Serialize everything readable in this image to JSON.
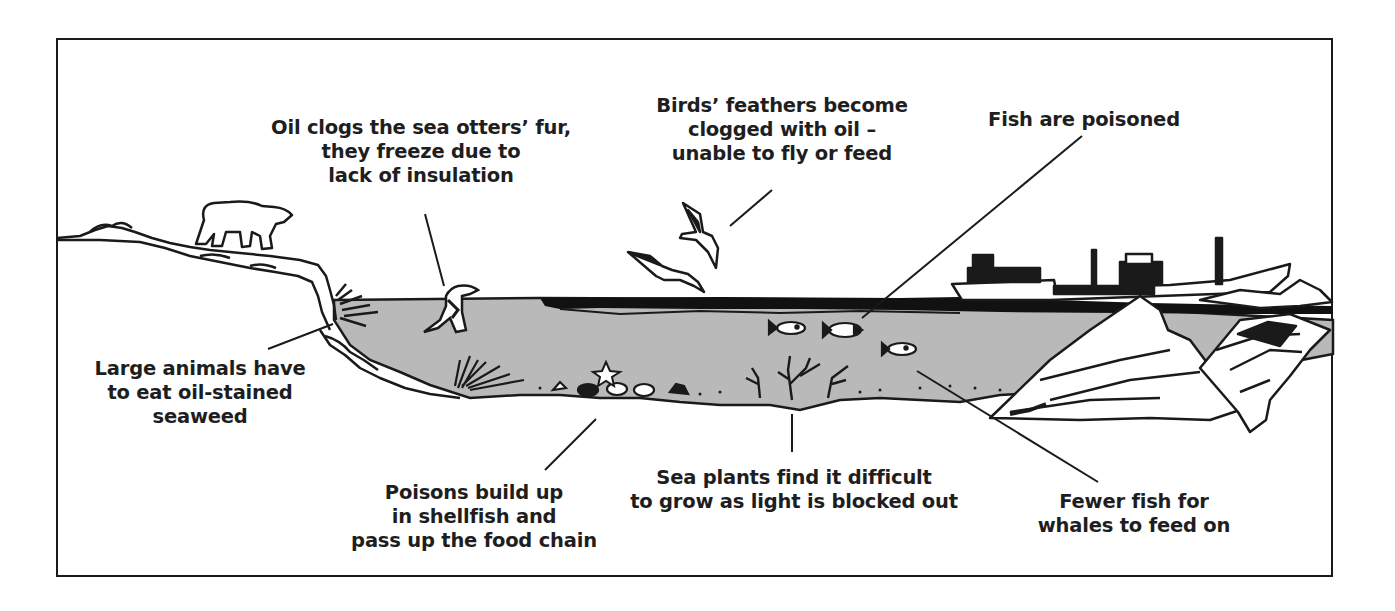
{
  "diagram": {
    "colors": {
      "sea": "#b9b9b9",
      "ink": "#1a1a1a",
      "paper": "#ffffff",
      "oil": "#111111"
    },
    "scene_elements": [
      "polar-bear",
      "shoreline",
      "sea-otter",
      "birds",
      "oil-slick",
      "tanker-ship",
      "fish",
      "shellfish",
      "starfish",
      "seaweed",
      "sea-plants",
      "icy-rocks"
    ],
    "labels": [
      {
        "id": "sea-otters",
        "lines": [
          "Oil clogs the sea otters’ fur,",
          "they freeze due to",
          "lack of insulation"
        ],
        "x": 421,
        "y": 116,
        "points_to": "sea-otter"
      },
      {
        "id": "birds",
        "lines": [
          "Birds’ feathers become",
          "clogged with oil –",
          "unable to fly or feed"
        ],
        "x": 782,
        "y": 94,
        "points_to": "birds"
      },
      {
        "id": "fish-poisoned",
        "lines": [
          "Fish are poisoned"
        ],
        "x": 1084,
        "y": 108,
        "points_to": "fish"
      },
      {
        "id": "large-animals",
        "lines": [
          "Large animals have",
          "to eat oil-stained",
          "seaweed"
        ],
        "x": 200,
        "y": 357,
        "points_to": "seaweed"
      },
      {
        "id": "shellfish",
        "lines": [
          "Poisons build up",
          "in shellfish and",
          "pass up the food chain"
        ],
        "x": 474,
        "y": 481,
        "points_to": "shellfish"
      },
      {
        "id": "sea-plants",
        "lines": [
          "Sea plants find it difficult",
          "to grow as light is blocked out"
        ],
        "x": 794,
        "y": 466,
        "points_to": "sea-plants"
      },
      {
        "id": "whales",
        "lines": [
          "Fewer fish for",
          "whales to feed on"
        ],
        "x": 1134,
        "y": 490,
        "points_to": "fish"
      }
    ],
    "leader_lines": [
      {
        "id": "sea-otters",
        "x1": 425,
        "y1": 214,
        "x2": 444,
        "y2": 286
      },
      {
        "id": "birds",
        "x1": 772,
        "y1": 190,
        "x2": 730,
        "y2": 226
      },
      {
        "id": "fish-poisoned",
        "x1": 1082,
        "y1": 136,
        "x2": 862,
        "y2": 318
      },
      {
        "id": "large-animals",
        "x1": 268,
        "y1": 349,
        "x2": 333,
        "y2": 324
      },
      {
        "id": "shellfish",
        "x1": 545,
        "y1": 470,
        "x2": 596,
        "y2": 419
      },
      {
        "id": "sea-plants",
        "x1": 792,
        "y1": 414,
        "x2": 792,
        "y2": 452
      },
      {
        "id": "whales",
        "x1": 1098,
        "y1": 482,
        "x2": 917,
        "y2": 371
      }
    ]
  }
}
